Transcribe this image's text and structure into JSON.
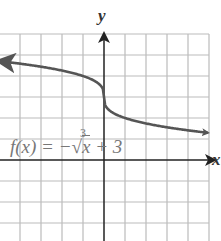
{
  "chart_data": {
    "type": "line",
    "title": "",
    "function_label": "f(x) = -∛x + 3",
    "xlabel": "x",
    "ylabel": "y",
    "grid": true,
    "xlim": [
      -5,
      5
    ],
    "ylim": [
      -4,
      6
    ],
    "series": [
      {
        "name": "f(x) = -∛x + 3",
        "x": [
          -5,
          -4,
          -3,
          -2,
          -1,
          -0.5,
          -0.1,
          0,
          0.1,
          0.5,
          1,
          2,
          3,
          4,
          5
        ],
        "y": [
          4.71,
          4.59,
          4.44,
          4.26,
          4.0,
          3.79,
          3.46,
          3.0,
          2.54,
          2.21,
          2.0,
          1.74,
          1.56,
          1.41,
          1.29
        ]
      }
    ],
    "colors": {
      "curve": "#555555",
      "grid": "#bbbbbb",
      "axes": "#222222"
    }
  },
  "labels": {
    "x_axis": "x",
    "y_axis": "y",
    "function_text": "f(x) = −",
    "function_radicand": "x",
    "function_tail": " + 3",
    "root_index": "3"
  }
}
